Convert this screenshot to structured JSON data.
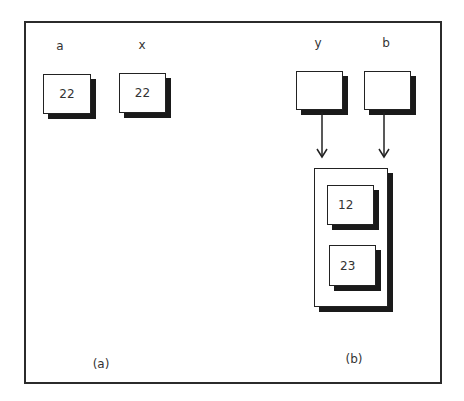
{
  "diagram": {
    "part_a": {
      "caption": "(a)",
      "variables": [
        {
          "name": "a",
          "value": "22"
        },
        {
          "name": "x",
          "value": "22"
        }
      ]
    },
    "part_b": {
      "caption": "(b)",
      "references": [
        {
          "name": "y",
          "value": ""
        },
        {
          "name": "b",
          "value": ""
        }
      ],
      "shared_object": {
        "fields": [
          {
            "value": "12"
          },
          {
            "value": "23"
          }
        ]
      },
      "arrows": [
        {
          "from": "y",
          "to": "shared_object"
        },
        {
          "from": "b",
          "to": "shared_object"
        }
      ]
    }
  }
}
